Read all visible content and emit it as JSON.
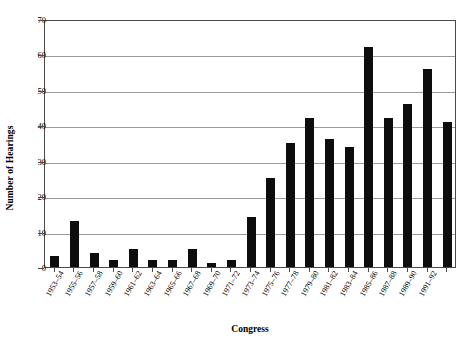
{
  "chart_data": {
    "type": "bar",
    "title": "",
    "xlabel": "Congress",
    "ylabel": "Number of Hearings",
    "categories": [
      "1953–54",
      "1955–56",
      "1957–58",
      "1959–60",
      "1961–62",
      "1963–64",
      "1965–66",
      "1967–68",
      "1969–70",
      "1971–72",
      "1973–74",
      "1975–76",
      "1977–78",
      "1979–80",
      "1981–82",
      "1983–84",
      "1985–86",
      "1987–88",
      "1989–90",
      "1991–92"
    ],
    "values": [
      3,
      13,
      4,
      2,
      5,
      2,
      2,
      5,
      1,
      2,
      14,
      25,
      35,
      42,
      36,
      34,
      62,
      42,
      46,
      56
    ],
    "ylim": [
      0,
      70
    ],
    "ytick_values": [
      0,
      10,
      20,
      30,
      40,
      50,
      60,
      70
    ],
    "ytick_labels": [
      "0",
      "10",
      "20",
      "30",
      "40",
      "50",
      "60",
      "70"
    ],
    "grid": true,
    "legend": false,
    "bar_color": "#0d0d0d",
    "grid_color": "#9a9a9a",
    "axis_color": "#4a4a4a"
  },
  "extra_bars": {
    "note": "final category values",
    "last_value": 41
  }
}
